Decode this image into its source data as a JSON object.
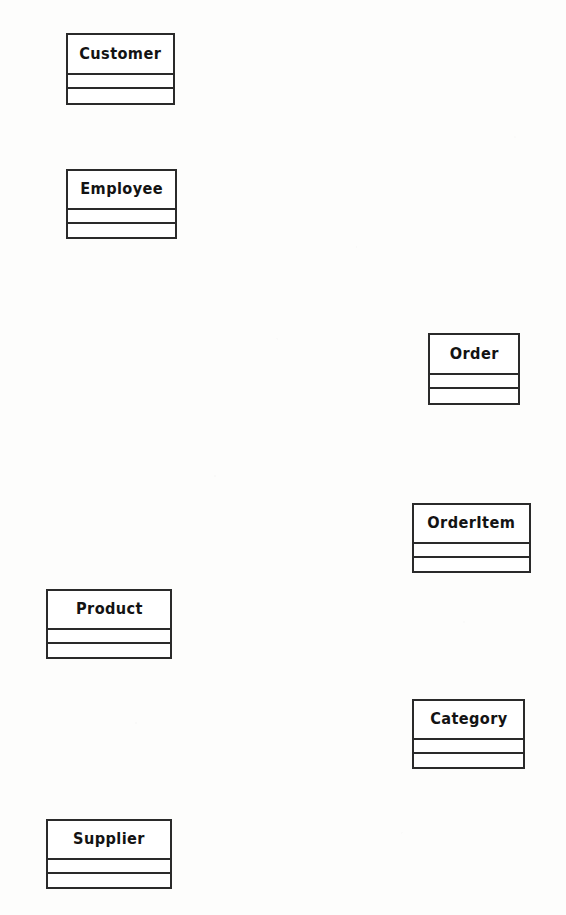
{
  "diagram": {
    "type": "uml-class-diagram",
    "background_color": "#fdfdfc",
    "line_color": "#2a2a2a",
    "fill_color": "#ffffff",
    "text_color": "#131313",
    "connections": [],
    "classes": [
      {
        "name": "Customer",
        "x": 66,
        "y": 33,
        "width": 109,
        "height": 72,
        "name_height": 40,
        "attributes_height": 14,
        "attributes": [],
        "operations": []
      },
      {
        "name": "Employee",
        "x": 66,
        "y": 169,
        "width": 111,
        "height": 70,
        "name_height": 39,
        "attributes_height": 14,
        "attributes": [],
        "operations": []
      },
      {
        "name": "Order",
        "x": 428,
        "y": 333,
        "width": 92,
        "height": 72,
        "name_height": 40,
        "attributes_height": 14,
        "attributes": [],
        "operations": []
      },
      {
        "name": "OrderItem",
        "x": 412,
        "y": 503,
        "width": 119,
        "height": 70,
        "name_height": 39,
        "attributes_height": 14,
        "attributes": [],
        "operations": []
      },
      {
        "name": "Product",
        "x": 46,
        "y": 589,
        "width": 126,
        "height": 70,
        "name_height": 39,
        "attributes_height": 14,
        "attributes": [],
        "operations": []
      },
      {
        "name": "Category",
        "x": 412,
        "y": 699,
        "width": 113,
        "height": 70,
        "name_height": 39,
        "attributes_height": 14,
        "attributes": [],
        "operations": []
      },
      {
        "name": "Supplier",
        "x": 46,
        "y": 819,
        "width": 126,
        "height": 70,
        "name_height": 39,
        "attributes_height": 14,
        "attributes": [],
        "operations": []
      }
    ]
  }
}
